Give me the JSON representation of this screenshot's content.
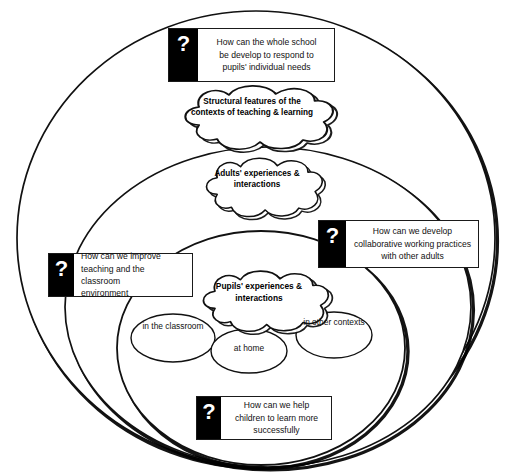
{
  "diagram": {
    "type": "nested-circles-venn",
    "background": "#ffffff",
    "stroke_color": "#111111",
    "shadow_color": "#000000"
  },
  "circles": [
    {
      "name": "structural-features-context",
      "label_ref": "clouds.0"
    },
    {
      "name": "adults-context",
      "label_ref": "clouds.1"
    },
    {
      "name": "pupils-context",
      "label_ref": "clouds.2"
    }
  ],
  "clouds": [
    {
      "id": "structural",
      "lines": [
        "Structural features of",
        "the contexts of",
        "teaching & learning"
      ],
      "bold": true
    },
    {
      "id": "adults",
      "lines": [
        "Adults'",
        "experiences &",
        "interactions"
      ],
      "bold": true
    },
    {
      "id": "pupils",
      "lines": [
        "Pupils'",
        "experiences &",
        "interactions"
      ],
      "bold": true
    }
  ],
  "ellipses": [
    {
      "id": "classroom",
      "lines": [
        "in the",
        "classroom"
      ]
    },
    {
      "id": "athome",
      "lines": [
        "at home"
      ]
    },
    {
      "id": "other",
      "lines": [
        "in other",
        "contexts"
      ]
    }
  ],
  "callouts": [
    {
      "id": "whole-school",
      "marker": "?",
      "align": "center",
      "lines": [
        "How can the whole school",
        "be develop to respond to",
        "pupils' individual needs"
      ]
    },
    {
      "id": "collaborative",
      "marker": "?",
      "align": "center",
      "lines": [
        "How can we develop",
        "collaborative working practices",
        "with other adults"
      ]
    },
    {
      "id": "improve-teaching",
      "marker": "?",
      "align": "left",
      "lines": [
        "How can we improve",
        "teaching and the classroom",
        "environment"
      ]
    },
    {
      "id": "help-children",
      "marker": "?",
      "align": "center",
      "lines": [
        "How can we help",
        "children to learn more",
        "successfully"
      ]
    }
  ]
}
